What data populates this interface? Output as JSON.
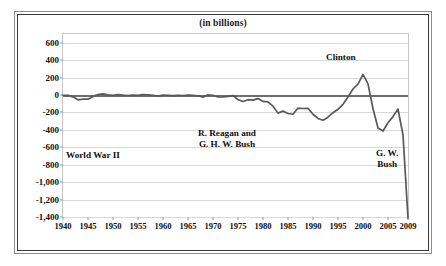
{
  "figure": {
    "title": "(in billions)",
    "frame": "double-rule-box"
  },
  "chart_data": {
    "type": "line",
    "title": "(in billions)",
    "subtitle": "",
    "xlabel": "",
    "ylabel": "",
    "units": "billions of dollars",
    "xlim": [
      1940,
      2009
    ],
    "ylim": [
      -1400,
      700
    ],
    "yticks": [
      600,
      400,
      200,
      0,
      -200,
      -400,
      -600,
      -800,
      -1000,
      -1200,
      -1400
    ],
    "ytick_labels": [
      "600",
      "400",
      "200",
      "0",
      "-200",
      "-400",
      "-600",
      "-800",
      "-1,000",
      "-1,200",
      "-1,400"
    ],
    "xticks": [
      1940,
      1945,
      1950,
      1955,
      1960,
      1965,
      1970,
      1975,
      1980,
      1985,
      1990,
      1995,
      2000,
      2005,
      2009
    ],
    "xtick_labels": [
      "1940",
      "1945",
      "1950",
      "1955",
      "1960",
      "1965",
      "1970",
      "1975",
      "1980",
      "1985",
      "1990",
      "1995",
      "2000",
      "2005",
      "2009"
    ],
    "grid": true,
    "grid_axis": "y",
    "legend": false,
    "zero_line": 0,
    "line_color": "#595959",
    "series": [
      {
        "name": "Federal surplus or deficit",
        "x": [
          1940,
          1941,
          1942,
          1943,
          1944,
          1945,
          1946,
          1947,
          1948,
          1949,
          1950,
          1951,
          1952,
          1953,
          1954,
          1955,
          1956,
          1957,
          1958,
          1959,
          1960,
          1961,
          1962,
          1963,
          1964,
          1965,
          1966,
          1967,
          1968,
          1969,
          1970,
          1971,
          1972,
          1973,
          1974,
          1975,
          1976,
          1977,
          1978,
          1979,
          1980,
          1981,
          1982,
          1983,
          1984,
          1985,
          1986,
          1987,
          1988,
          1989,
          1990,
          1991,
          1992,
          1993,
          1994,
          1995,
          1996,
          1997,
          1998,
          1999,
          2000,
          2001,
          2002,
          2003,
          2004,
          2005,
          2006,
          2007,
          2008,
          2009
        ],
        "values": [
          -3,
          -5,
          -21,
          -55,
          -48,
          -48,
          -16,
          4,
          12,
          1,
          -3,
          6,
          -2,
          -6,
          -1,
          -3,
          4,
          3,
          -3,
          -13,
          0,
          -3,
          -7,
          -5,
          -6,
          -1,
          -4,
          -9,
          -25,
          3,
          -3,
          -23,
          -23,
          -15,
          -6,
          -53,
          -74,
          -54,
          -59,
          -41,
          -74,
          -79,
          -128,
          -208,
          -185,
          -212,
          -221,
          -150,
          -155,
          -153,
          -221,
          -269,
          -290,
          -255,
          -203,
          -164,
          -107,
          -22,
          69,
          126,
          236,
          128,
          -158,
          -378,
          -413,
          -318,
          -248,
          -161,
          -459,
          -1413
        ]
      }
    ],
    "annotations": [
      {
        "text": "World War II",
        "x": 1944,
        "y": -640,
        "id": "world-war-ii"
      },
      {
        "text": "R. Reagan and\nG. H. W. Bush",
        "x": 1984,
        "y": -430,
        "id": "reagan-ghw-bush"
      },
      {
        "text": "Clinton",
        "x": 2000,
        "y": 330,
        "id": "clinton"
      },
      {
        "text": "G. W.\nBush",
        "x": 2006,
        "y": -670,
        "id": "gw-bush"
      }
    ]
  },
  "annotations": {
    "world_war_ii": "World War II",
    "reagan_bush": "R. Reagan and\nG. H. W. Bush",
    "clinton": "Clinton",
    "gw_bush": "G. W.\nBush"
  },
  "colors": {
    "line": "#595959",
    "zero_axis": "#6f6f6f",
    "gridline": "#d9d9d9",
    "frame_outer": "#8d8d8d",
    "frame_inner": "#3a3a3a",
    "text": "#111111",
    "background": "#ffffff"
  }
}
